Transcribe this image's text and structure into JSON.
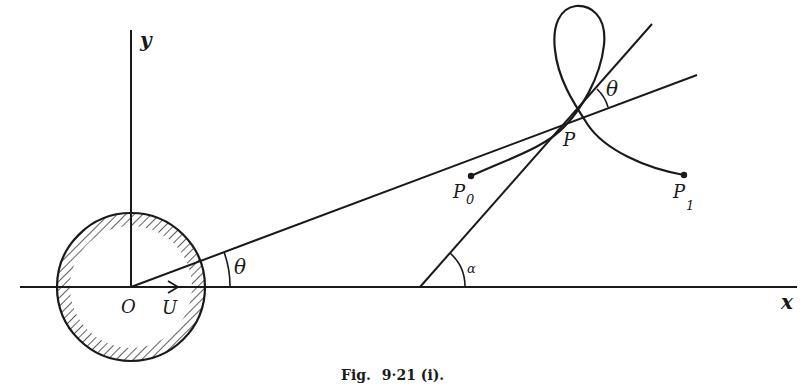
{
  "figure": {
    "caption": "Fig. 9·21 (i).",
    "caption_smallcaps_prefix": "Fig.",
    "caption_number": "9·21 (i)."
  },
  "labels": {
    "y_axis": "y",
    "x_axis": "x",
    "origin": "O",
    "velocity": "U",
    "theta_near_origin": "θ",
    "theta_at_P": "θ",
    "alpha": "α",
    "point_P": "P",
    "point_P0": "P",
    "point_P0_sub": "0",
    "point_P1": "P",
    "point_P1_sub": "1"
  },
  "colors": {
    "ink": "#1a1a1a",
    "background": "#ffffff"
  }
}
